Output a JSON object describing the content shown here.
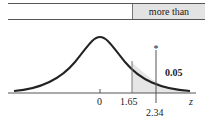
{
  "table": {
    "header_cell": "more than"
  },
  "diagram": {
    "type": "normal-distribution-right-tail",
    "axis_label": "z",
    "ticks": [
      {
        "label": "0",
        "value": 0
      },
      {
        "label": "1.65",
        "value": 1.65
      },
      {
        "label": "2.34",
        "value": 2.34
      }
    ],
    "shaded_region": {
      "from": "1.65",
      "to": "infinity",
      "area_label": "0.05"
    },
    "marker": {
      "symbol": "*",
      "at": "2.34"
    },
    "colors": {
      "curve": "#222222",
      "shade": "#e6e6e6",
      "line": "#555555"
    }
  }
}
